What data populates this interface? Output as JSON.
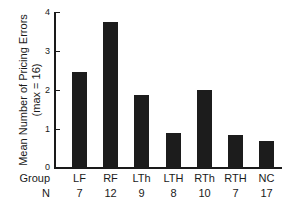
{
  "chart_data": {
    "type": "bar",
    "title": "",
    "xlabel": "Group",
    "ylabel": "Mean Number of Pricing Errors",
    "ylabel_sub": "(max = 16)",
    "categories": [
      "LF",
      "RF",
      "LTh",
      "LTH",
      "RTh",
      "RTH",
      "NC"
    ],
    "values": [
      2.45,
      3.74,
      1.88,
      0.89,
      2.0,
      0.85,
      0.69
    ],
    "n_label": "N",
    "n_values": [
      "7",
      "12",
      "9",
      "8",
      "10",
      "7",
      "17"
    ],
    "ylim": [
      0,
      4
    ],
    "yticks": [
      "0",
      "1",
      "2",
      "3",
      "4"
    ],
    "grid": false,
    "legend": null,
    "bar_color": "#1c1c1c"
  }
}
